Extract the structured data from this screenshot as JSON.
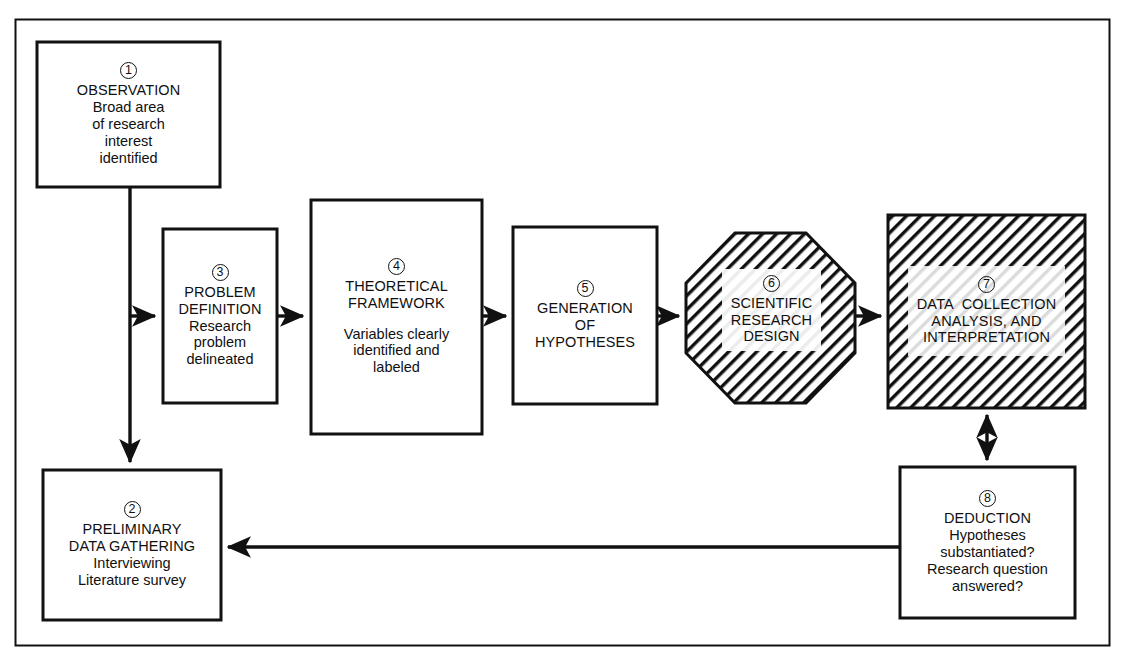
{
  "figure": {
    "frame": {
      "stroke": "#111111"
    }
  },
  "nodes": [
    {
      "id": "observation",
      "number": "1",
      "shape": "rect",
      "fill": "white",
      "heading": [
        "OBSERVATION"
      ],
      "body": [
        "Broad area",
        "of research",
        "interest",
        "identified"
      ]
    },
    {
      "id": "preliminary-data-gathering",
      "number": "2",
      "shape": "rect",
      "fill": "white",
      "heading": [
        "PRELIMINARY",
        "DATA GATHERING"
      ],
      "body": [
        "Interviewing",
        "Literature survey"
      ]
    },
    {
      "id": "problem-definition",
      "number": "3",
      "shape": "rect",
      "fill": "white",
      "heading": [
        "PROBLEM",
        "DEFINITION"
      ],
      "body": [
        "Research",
        "problem",
        "delineated"
      ]
    },
    {
      "id": "theoretical-framework",
      "number": "4",
      "shape": "rect",
      "fill": "white",
      "heading": [
        "THEORETICAL",
        "FRAMEWORK"
      ],
      "body": [
        "Variables clearly",
        "identified and",
        "labeled"
      ]
    },
    {
      "id": "generation-of-hypotheses",
      "number": "5",
      "shape": "rect",
      "fill": "white",
      "heading": [
        "GENERATION",
        "OF",
        "HYPOTHESES"
      ],
      "body": []
    },
    {
      "id": "scientific-research-design",
      "number": "6",
      "shape": "octagon",
      "fill": "hatched",
      "heading": [
        "SCIENTIFIC",
        "RESEARCH",
        "DESIGN"
      ],
      "body": []
    },
    {
      "id": "data-collection-analysis-interpretation",
      "number": "7",
      "shape": "rect",
      "fill": "hatched",
      "heading": [
        "DATA  COLLECTION",
        "ANALYSIS, AND",
        "INTERPRETATION"
      ],
      "body": []
    },
    {
      "id": "deduction",
      "number": "8",
      "shape": "rect",
      "fill": "white",
      "heading": [
        "DEDUCTION"
      ],
      "body": [
        "Hypotheses",
        "substantiated?",
        "Research question",
        "answered?"
      ]
    }
  ],
  "connections": [
    {
      "from": "1",
      "to": "2",
      "style": "single-arrow",
      "direction": "down"
    },
    {
      "from": "1",
      "to": "3",
      "style": "single-arrow",
      "direction": "right"
    },
    {
      "from": "3",
      "to": "4",
      "style": "single-arrow",
      "direction": "right"
    },
    {
      "from": "4",
      "to": "5",
      "style": "single-arrow",
      "direction": "right"
    },
    {
      "from": "5",
      "to": "6",
      "style": "single-arrow",
      "direction": "right"
    },
    {
      "from": "6",
      "to": "7",
      "style": "single-arrow",
      "direction": "right"
    },
    {
      "from": "7",
      "to": "8",
      "style": "double-arrow",
      "direction": "vertical"
    },
    {
      "from": "8",
      "to": "2",
      "style": "single-arrow",
      "direction": "left"
    }
  ]
}
